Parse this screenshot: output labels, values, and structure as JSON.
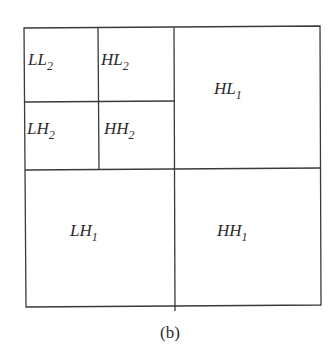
{
  "diagram": {
    "type": "wavelet-decomposition-subbands",
    "caption": "(b)",
    "level2": {
      "LL": {
        "base": "LL",
        "sub": "2"
      },
      "HL": {
        "base": "HL",
        "sub": "2"
      },
      "LH": {
        "base": "LH",
        "sub": "2"
      },
      "HH": {
        "base": "HH",
        "sub": "2"
      }
    },
    "level1": {
      "HL": {
        "base": "HL",
        "sub": "1"
      },
      "LH": {
        "base": "LH",
        "sub": "1"
      },
      "HH": {
        "base": "HH",
        "sub": "1"
      }
    },
    "line_color": "#3a3a3a"
  }
}
